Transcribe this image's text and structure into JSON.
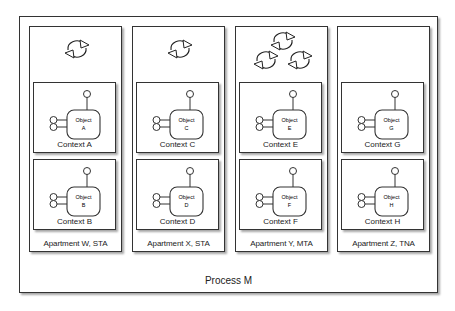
{
  "process": {
    "label": "Process M"
  },
  "apartments": [
    {
      "label": "Apartment W, STA",
      "sync_icons": 1,
      "contexts": [
        {
          "label": "Context A",
          "object": {
            "line1": "Object",
            "line2": "A"
          }
        },
        {
          "label": "Context B",
          "object": {
            "line1": "Object",
            "line2": "B"
          }
        }
      ]
    },
    {
      "label": "Apartment X, STA",
      "sync_icons": 1,
      "contexts": [
        {
          "label": "Context C",
          "object": {
            "line1": "Object",
            "line2": "C"
          }
        },
        {
          "label": "Context D",
          "object": {
            "line1": "Object",
            "line2": "D"
          }
        }
      ]
    },
    {
      "label": "Apartment Y, MTA",
      "sync_icons": 3,
      "contexts": [
        {
          "label": "Context E",
          "object": {
            "line1": "Object",
            "line2": "E"
          }
        },
        {
          "label": "Context F",
          "object": {
            "line1": "Object",
            "line2": "F"
          }
        }
      ]
    },
    {
      "label": "Apartment Z, TNA",
      "sync_icons": 0,
      "contexts": [
        {
          "label": "Context G",
          "object": {
            "line1": "Object",
            "line2": "G"
          }
        },
        {
          "label": "Context H",
          "object": {
            "line1": "Object",
            "line2": "H"
          }
        }
      ]
    }
  ],
  "icons": {
    "sync": "sync-arrows-icon",
    "interface": "lollipop-interface-icon"
  },
  "colors": {
    "stroke": "#333333",
    "background": "#ffffff"
  }
}
